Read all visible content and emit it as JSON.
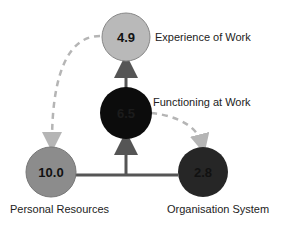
{
  "diagram": {
    "nodes": {
      "experience": {
        "label": "Experience of Work",
        "value": "4.9",
        "fill": "#b9b9b9",
        "text_color": "#111111"
      },
      "functioning": {
        "label": "Functioning at Work",
        "value": "6.5",
        "fill": "#0c0c0c",
        "text_color": "#1a1a1a"
      },
      "personal": {
        "label": "Personal Resources",
        "value": "10.0",
        "fill": "#8c8c8c",
        "text_color": "#111111"
      },
      "organisation": {
        "label": "Organisation System",
        "value": "2.8",
        "fill": "#262626",
        "text_color": "#111111"
      }
    },
    "edges": [
      {
        "from": "personal",
        "to": "functioning",
        "style": "solid"
      },
      {
        "from": "organisation",
        "to": "functioning",
        "style": "solid"
      },
      {
        "from": "functioning",
        "to": "experience",
        "style": "solid"
      },
      {
        "from": "experience",
        "to": "personal",
        "style": "dashed"
      },
      {
        "from": "functioning",
        "to": "organisation",
        "style": "dashed"
      }
    ],
    "colors": {
      "solid_line": "#555555",
      "dashed_line": "#b5b5b5"
    }
  }
}
